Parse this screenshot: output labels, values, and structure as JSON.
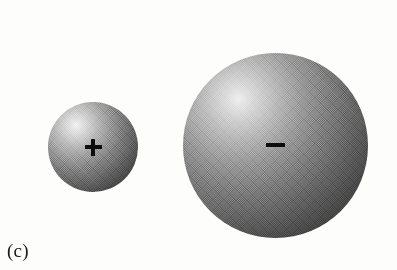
{
  "figure": {
    "panel_label": "(c)",
    "background_color": "#fdfdfc",
    "sign_color": "#0d0d0d",
    "objects": [
      {
        "id": "positive-sphere",
        "role": "small charged sphere",
        "charge_sign": "+",
        "charge_polarity": "positive",
        "fill": "gray radial shaded sphere",
        "highlight_color": "#f2f2f2",
        "shadow_color": "#252525",
        "center_x": 93,
        "center_y": 147,
        "diameter": 90
      },
      {
        "id": "negative-sphere",
        "role": "large charged sphere",
        "charge_sign": "−",
        "charge_polarity": "negative",
        "fill": "gray radial shaded sphere",
        "highlight_color": "#efefef",
        "shadow_color": "#262626",
        "center_x": 275,
        "center_y": 145,
        "diameter": 185
      }
    ]
  }
}
